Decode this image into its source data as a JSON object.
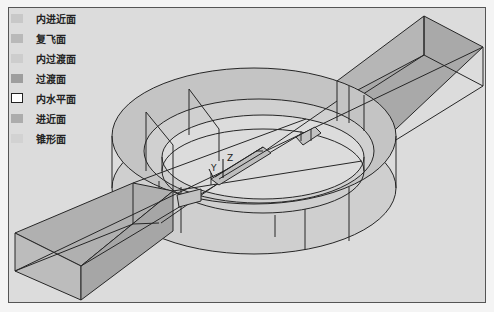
{
  "figure": {
    "legend": [
      {
        "label": "内进近面",
        "swatch": "#c8c8c8"
      },
      {
        "label": "复飞面",
        "swatch": "#b9b9b9"
      },
      {
        "label": "内过渡面",
        "swatch": "#cdcdcd"
      },
      {
        "label": "过渡面",
        "swatch": "#9e9e9e"
      },
      {
        "label": "内水平面",
        "swatch": "#ffffff"
      },
      {
        "label": "进近面",
        "swatch": "#acacac"
      },
      {
        "label": "锥形面",
        "swatch": "#d2d2d2"
      }
    ],
    "axes": {
      "y_label": "Y",
      "z_label": "Z"
    },
    "colors": {
      "background": "#dcdcdc",
      "surface_dark": "#a9a9a9",
      "surface_mid": "#bdbdbd",
      "surface_light": "#cfcfcf",
      "line": "#262626"
    }
  }
}
